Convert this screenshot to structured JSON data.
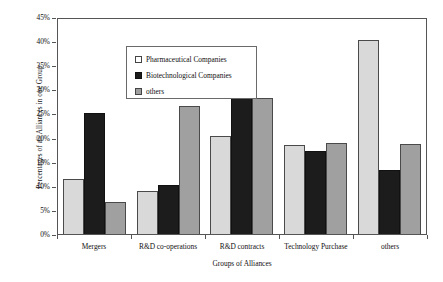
{
  "chart_data": {
    "type": "bar",
    "title": "",
    "xlabel": "Groups of Alliances",
    "ylabel": "Percentages of all Alliances in one Group",
    "categories": [
      "Mergers",
      "R&D co-operations",
      "R&D contracts",
      "Technology Purchase",
      "others"
    ],
    "series": [
      {
        "name": "Pharmaceutical Companies",
        "color": "#d9d9d9",
        "values": [
          11.5,
          9.0,
          20.4,
          18.5,
          40.3
        ]
      },
      {
        "name": "Biotechnological Companies",
        "color": "#1c1c1c",
        "values": [
          25.0,
          10.1,
          34.0,
          17.3,
          13.2
        ]
      },
      {
        "name": "others",
        "color": "#a0a0a0",
        "values": [
          6.7,
          26.6,
          28.2,
          18.8,
          18.7
        ]
      }
    ],
    "ylim": [
      0,
      45
    ],
    "ytick_values": [
      0,
      5,
      10,
      15,
      20,
      25,
      30,
      35,
      40,
      45
    ],
    "ytick_labels": [
      "0%",
      "5%",
      "10%",
      "15%",
      "20%",
      "25%",
      "30%",
      "35%",
      "40%",
      "45%"
    ],
    "grid": false,
    "legend_position": "upper-left-inside"
  },
  "legend": {
    "entries": [
      {
        "label": "Pharmaceutical Companies",
        "swatch": "legend-swatch-pharmaceutical"
      },
      {
        "label": "Biotechnological Companies",
        "swatch": "legend-swatch-biotechnological"
      },
      {
        "label": "others",
        "swatch": "legend-swatch-others"
      }
    ]
  }
}
